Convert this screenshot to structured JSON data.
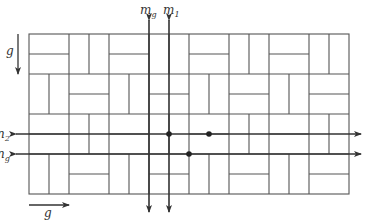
{
  "diagram": {
    "type": "parquet-tiling-symmetry",
    "grid": {
      "origin": [
        29,
        34
      ],
      "cell": 20,
      "block_cells": 2,
      "block_cols": 8,
      "block_rows": 4,
      "pattern": "checkerboard: block split horizontally when (col+row) even, vertically when odd",
      "line_color": "#555555"
    },
    "glide_arrows": [
      {
        "id": "g-vertical",
        "label": "g",
        "direction": "down",
        "from": [
          18,
          34
        ],
        "to": [
          18,
          74
        ],
        "label_pos": [
          6,
          55
        ]
      },
      {
        "id": "g-horizontal",
        "label": "g",
        "direction": "right",
        "from": [
          29,
          205
        ],
        "to": [
          69,
          205
        ],
        "label_pos": [
          44,
          217
        ]
      }
    ],
    "axes": [
      {
        "id": "m-g",
        "label": "m",
        "subscript": "g",
        "orientation": "vertical",
        "x": 149,
        "y1": 20,
        "y2": 212,
        "label_pos": [
          140,
          14
        ]
      },
      {
        "id": "m-1",
        "label": "m",
        "subscript": "1",
        "orientation": "vertical",
        "x": 169,
        "y1": 20,
        "y2": 212,
        "label_pos": [
          163,
          14
        ]
      },
      {
        "id": "n-2",
        "label": "n",
        "subscript": "2",
        "orientation": "horizontal",
        "y": 134,
        "x1": 16,
        "x2": 361,
        "label_pos": [
          -3,
          138
        ]
      },
      {
        "id": "n-g",
        "label": "n",
        "subscript": "g",
        "orientation": "horizontal",
        "y": 154,
        "x1": 16,
        "x2": 361,
        "label_pos": [
          -3,
          158
        ]
      }
    ],
    "points": [
      {
        "id": "p1",
        "x": 169,
        "y": 134
      },
      {
        "id": "p2",
        "x": 209,
        "y": 134
      },
      {
        "id": "p3",
        "x": 189,
        "y": 154
      }
    ],
    "colors": {
      "grid": "#555555",
      "axis": "#333333",
      "point": "#222222",
      "background": "#ffffff"
    }
  }
}
